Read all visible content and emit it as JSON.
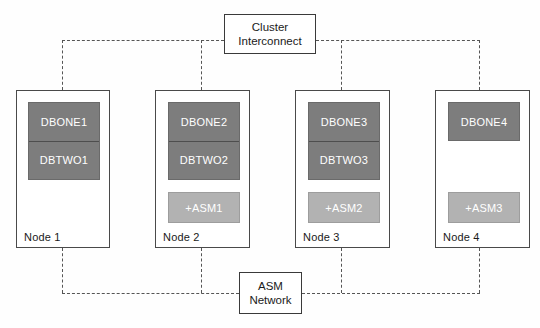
{
  "diagram": {
    "colors": {
      "db_instance_fill": "#7d7d7d",
      "asm_instance_fill": "#b2b2b2",
      "node_border": "#4a4a4a",
      "connector_line": "#555555",
      "background": "#fefefe",
      "instance_text": "#ffffff"
    },
    "top_network": {
      "line1": "Cluster",
      "line2": "Interconnect"
    },
    "bottom_network": {
      "line1": "ASM",
      "line2": "Network"
    },
    "nodes": [
      {
        "label": "Node 1",
        "db_instances": [
          "DBONE1",
          "DBTWO1"
        ],
        "asm_instance": null
      },
      {
        "label": "Node 2",
        "db_instances": [
          "DBONE2",
          "DBTWO2"
        ],
        "asm_instance": "+ASM1"
      },
      {
        "label": "Node 3",
        "db_instances": [
          "DBONE3",
          "DBTWO3"
        ],
        "asm_instance": "+ASM2"
      },
      {
        "label": "Node 4",
        "db_instances": [
          "DBONE4"
        ],
        "asm_instance": "+ASM3"
      }
    ]
  }
}
